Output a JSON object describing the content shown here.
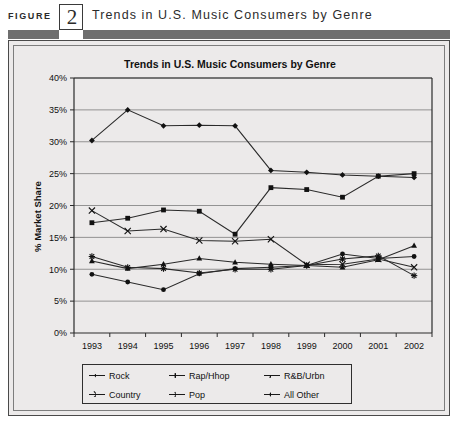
{
  "figure": {
    "label": "FIGURE",
    "number": "2",
    "title": "Trends in U.S. Music Consumers by Genre"
  },
  "chart_data": {
    "type": "line",
    "title": "Trends in U.S. Music Consumers by Genre",
    "xlabel": "",
    "ylabel": "% Market Share",
    "categories": [
      "1993",
      "1994",
      "1995",
      "1996",
      "1997",
      "1998",
      "1999",
      "2000",
      "2001",
      "2002"
    ],
    "ylim": [
      0,
      40
    ],
    "ytick_labels": [
      "0%",
      "5%",
      "10%",
      "15%",
      "20%",
      "25%",
      "30%",
      "35%",
      "40%"
    ],
    "ytick_values": [
      0,
      5,
      10,
      15,
      20,
      25,
      30,
      35,
      40
    ],
    "grid": true,
    "legend_position": "bottom",
    "series": [
      {
        "name": "Rock",
        "marker": "diamond",
        "values": [
          30.2,
          35.0,
          32.5,
          32.6,
          32.5,
          25.5,
          25.2,
          24.8,
          24.6,
          24.4
        ]
      },
      {
        "name": "Rap/Hhop",
        "marker": "square",
        "values": [
          17.3,
          18.0,
          19.3,
          19.1,
          15.5,
          22.8,
          22.5,
          21.3,
          24.6,
          25.0
        ]
      },
      {
        "name": "R&B/Urbn",
        "marker": "triangle",
        "values": [
          11.3,
          10.1,
          10.8,
          11.7,
          11.1,
          10.8,
          10.6,
          10.3,
          11.5,
          13.7
        ]
      },
      {
        "name": "Country",
        "marker": "cross",
        "values": [
          19.2,
          16.0,
          16.3,
          14.5,
          14.4,
          14.7,
          10.7,
          10.8,
          11.6,
          10.3
        ]
      },
      {
        "name": "Pop",
        "marker": "star",
        "values": [
          12.0,
          10.3,
          10.1,
          9.4,
          10.0,
          10.0,
          10.6,
          11.6,
          12.1,
          9.0
        ]
      },
      {
        "name": "All Other",
        "marker": "dot",
        "values": [
          9.2,
          8.0,
          6.8,
          9.3,
          10.1,
          10.3,
          10.6,
          12.4,
          11.7,
          12.0
        ]
      }
    ]
  }
}
